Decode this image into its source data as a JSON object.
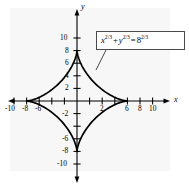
{
  "figure": {
    "background_color": "#ffffff",
    "panel_color": "#f7f7f7",
    "curve_color": "#000000",
    "axis_color": "#000000",
    "box_border_color": "#4a4a4a"
  },
  "annotation": {
    "equation_plain": "x^(2/3) + y^(2/3) = 8^(2/3)",
    "base_x": "x",
    "exp_x": "2/3",
    "plus": "+",
    "base_y": "y",
    "exp_y": "2/3",
    "equals": "=",
    "base_r": "8",
    "exp_r": "2/3"
  },
  "axes": {
    "x_label": "x",
    "y_label": "y",
    "x_ticklabels": [
      "-10",
      "-8",
      "-6",
      "2",
      "6",
      "8",
      "10"
    ],
    "y_ticklabels": [
      "10",
      "8",
      "6",
      "4",
      "2",
      "-2",
      "-6",
      "-8",
      "-10"
    ]
  },
  "chart_data": {
    "type": "line",
    "title": "",
    "xlabel": "x",
    "ylabel": "y",
    "xlim": [
      -11,
      11
    ],
    "ylim": [
      -11,
      11
    ],
    "grid": false,
    "legend": null,
    "annotations": [
      {
        "text": "x^(2/3) + y^(2/3) = 8^(2/3)",
        "type": "equation-box-with-leader",
        "points_to": [
          4.2,
          4.2
        ]
      }
    ],
    "xticks": [
      -10,
      -8,
      -6,
      -4,
      -2,
      2,
      4,
      6,
      8,
      10
    ],
    "xtick_labels": [
      "-10",
      "-8",
      "-6",
      "",
      "",
      "2",
      "",
      "6",
      "8",
      "10"
    ],
    "yticks": [
      -10,
      -8,
      -6,
      -4,
      -2,
      2,
      4,
      6,
      8,
      10
    ],
    "ytick_labels": [
      "-10",
      "-8",
      "-6",
      "",
      "-2",
      "2",
      "4",
      "6",
      "8",
      "10"
    ],
    "series": [
      {
        "name": "astroid: x^(2/3) + y^(2/3) = 8^(2/3)",
        "equation": "x^(2/3) + y^(2/3) = 8^(2/3)",
        "parametric": "x = 8 cos^3(t), y = 8 sin^3(t)",
        "closed": true,
        "cusps": [
          [
            8,
            0
          ],
          [
            0,
            8
          ],
          [
            -8,
            0
          ],
          [
            0,
            -8
          ]
        ],
        "x": [
          8,
          7.71,
          6.9,
          5.73,
          4.38,
          3.03,
          1.85,
          0.92,
          0.3,
          0.04,
          0,
          -0.04,
          -0.3,
          -0.92,
          -1.85,
          -3.03,
          -4.38,
          -5.73,
          -6.9,
          -7.71,
          -8,
          -7.71,
          -6.9,
          -5.73,
          -4.38,
          -3.03,
          -1.85,
          -0.92,
          -0.3,
          -0.04,
          0,
          0.04,
          0.3,
          0.92,
          1.85,
          3.03,
          4.38,
          5.73,
          6.9,
          7.71,
          8
        ],
        "y": [
          0,
          0.04,
          0.3,
          0.92,
          1.85,
          3.03,
          4.38,
          5.73,
          6.9,
          7.71,
          8,
          7.71,
          6.9,
          5.73,
          4.38,
          3.03,
          1.85,
          0.92,
          0.3,
          0.04,
          0,
          -0.04,
          -0.3,
          -0.92,
          -1.85,
          -3.03,
          -4.38,
          -5.73,
          -6.9,
          -7.71,
          -8,
          -7.71,
          -6.9,
          -5.73,
          -4.38,
          -3.03,
          -1.85,
          -0.92,
          -0.3,
          -0.04,
          0
        ]
      }
    ]
  }
}
